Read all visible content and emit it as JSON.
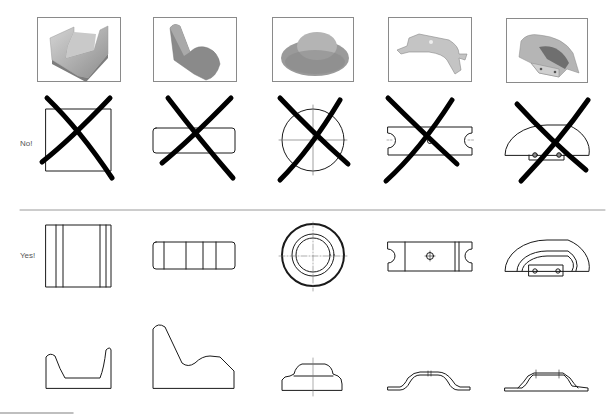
{
  "labels": {
    "no": "No!",
    "yes": "Yes!"
  },
  "parts": [
    {
      "name": "u-channel-block",
      "photo": "grey U-shaped channel block",
      "wrong_view": "square outline (crossed out)",
      "correct_front": "rectangle with vertical lines",
      "correct_side": "U-profile"
    },
    {
      "name": "seat-shaped-block",
      "photo": "grey L/seat-shaped wedge",
      "wrong_view": "rounded rectangle (crossed out)",
      "correct_front": "rounded rectangle divided into segments",
      "correct_side": "curved wedge profile"
    },
    {
      "name": "stepped-round-knob",
      "photo": "grey stepped round knob",
      "wrong_view": "circle with center lines (crossed out)",
      "correct_front": "concentric circles with center lines",
      "correct_side": "stepped dome profile with center line"
    },
    {
      "name": "bent-strap-bracket",
      "photo": "bent sheet-metal strap with hole",
      "wrong_view": "slotted rectangle (crossed out)",
      "correct_front": "slotted rectangle with center hole",
      "correct_side": "bent strap profile"
    },
    {
      "name": "formed-cover",
      "photo": "formed sheet-metal cover with tab",
      "wrong_view": "half-round outline with tab (crossed out)",
      "correct_front": "half-round with inner arcs and tab holes",
      "correct_side": "formed flange profile"
    }
  ],
  "colors": {
    "line": "#1a1a1a",
    "cross": "#000000",
    "frame": "#8a8a8a",
    "divider": "#9a9a9a",
    "centerline": "#777777",
    "label": "#555555"
  }
}
